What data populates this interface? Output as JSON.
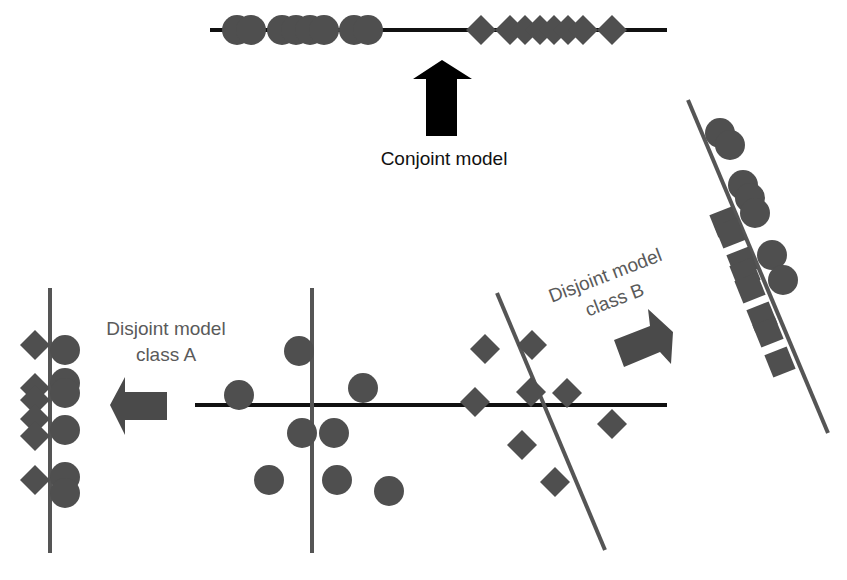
{
  "colors": {
    "marker": "#4f4f4f",
    "axis_black": "#111111",
    "axis_gray": "#555555",
    "arrow_black": "#000000",
    "arrow_gray": "#4a4a4a"
  },
  "labels": {
    "conjoint": "Conjoint model",
    "class_a_line1": "Disjoint model",
    "class_a_line2": "class A",
    "class_b_line1": "Disjoint model",
    "class_b_line2": "class B"
  },
  "panels": {
    "conjoint": {
      "axis": {
        "x1": 210,
        "y1": 30,
        "x2": 667,
        "y2": 30,
        "color": "axis_black"
      },
      "circles": [
        [
          237,
          30
        ],
        [
          251,
          30
        ],
        [
          282,
          30
        ],
        [
          296,
          30
        ],
        [
          310,
          30
        ],
        [
          324,
          30
        ],
        [
          354,
          30
        ],
        [
          368,
          30
        ]
      ],
      "diamonds": [
        [
          481,
          30
        ],
        [
          510,
          30
        ],
        [
          525,
          30
        ],
        [
          540,
          30
        ],
        [
          554,
          30
        ],
        [
          568,
          30
        ],
        [
          583,
          30
        ],
        [
          612,
          30
        ]
      ]
    },
    "original": {
      "axes": [
        {
          "x1": 195,
          "y1": 405,
          "x2": 667,
          "y2": 405,
          "color": "axis_black"
        },
        {
          "x1": 312,
          "y1": 288,
          "x2": 312,
          "y2": 553,
          "color": "axis_gray"
        },
        {
          "x1": 497,
          "y1": 293,
          "x2": 605,
          "y2": 550,
          "color": "axis_gray"
        }
      ],
      "circles": [
        [
          239,
          395
        ],
        [
          299,
          351
        ],
        [
          363,
          388
        ],
        [
          302,
          433
        ],
        [
          334,
          433
        ],
        [
          269,
          480
        ],
        [
          337,
          480
        ],
        [
          389,
          491
        ]
      ],
      "diamonds": [
        [
          485,
          349
        ],
        [
          532,
          345
        ],
        [
          531,
          392
        ],
        [
          567,
          393
        ],
        [
          475,
          402
        ],
        [
          612,
          424
        ],
        [
          522,
          445
        ],
        [
          555,
          482
        ]
      ]
    },
    "class_a": {
      "axis": {
        "x1": 50,
        "y1": 288,
        "x2": 50,
        "y2": 553,
        "color": "axis_gray"
      },
      "circles": [
        [
          65,
          350
        ],
        [
          65,
          383
        ],
        [
          65,
          393
        ],
        [
          65,
          430
        ],
        [
          65,
          477
        ],
        [
          65,
          493
        ]
      ],
      "diamonds": [
        [
          35,
          345
        ],
        [
          35,
          388
        ],
        [
          35,
          400
        ],
        [
          35,
          419
        ],
        [
          35,
          436
        ],
        [
          35,
          480
        ]
      ]
    },
    "class_b": {
      "axis": {
        "x1": 688,
        "y1": 100,
        "x2": 828,
        "y2": 433,
        "color": "axis_gray"
      },
      "circles": [
        [
          720,
          133
        ],
        [
          730,
          145
        ],
        [
          743,
          185
        ],
        [
          750,
          198
        ],
        [
          755,
          213
        ],
        [
          772,
          255
        ],
        [
          783,
          280
        ]
      ],
      "squares": [
        [
          725,
          222
        ],
        [
          730,
          233
        ],
        [
          742,
          262
        ],
        [
          745,
          273
        ],
        [
          750,
          288
        ],
        [
          762,
          317
        ],
        [
          768,
          332
        ],
        [
          780,
          362
        ]
      ],
      "square_rotation": -22
    }
  },
  "arrows": {
    "conjoint_up": {
      "points": "442,60 472,79 457,79 457,136 426,136 426,79 413,79",
      "color": "arrow_black"
    },
    "to_class_a": {
      "points": "110,405 125,377 125,392 167,392 167,420 125,420 125,435",
      "color": "arrow_gray"
    },
    "to_class_b": {
      "points": "614,340 650,326 648,309 673,332 671,364 660,352 624,367",
      "color": "arrow_gray"
    }
  },
  "marker_sizes": {
    "circle_r": 15,
    "diamond_half": 15,
    "square_half": 12
  }
}
